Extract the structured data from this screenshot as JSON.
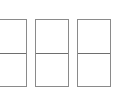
{
  "panels": [
    {
      "id": "panel-1",
      "left": -1,
      "width": 28
    },
    {
      "id": "panel-2",
      "left": 35,
      "width": 34
    },
    {
      "id": "panel-3",
      "left": 77,
      "width": 34
    }
  ],
  "colors": {
    "border": "#8a8a8a",
    "divider": "#6e6e6e",
    "background": "#ffffff"
  },
  "footer": {
    "text": ""
  }
}
